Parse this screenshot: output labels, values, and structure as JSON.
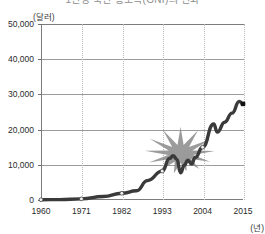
{
  "chart_data": {
    "type": "line",
    "title": "1인당 국민 총소득(GNI)의 변화",
    "unit_y": "(달러)",
    "unit_x": "(년)",
    "xlabel": "",
    "ylabel": "",
    "ylim": [
      0,
      50000
    ],
    "xlim": [
      1960,
      2015
    ],
    "yticks": [
      "0",
      "10,000",
      "20,000",
      "30,000",
      "40,000",
      "50,000"
    ],
    "ytick_values": [
      0,
      10000,
      20000,
      30000,
      40000,
      50000
    ],
    "xticks": [
      "1960",
      "1971",
      "1982",
      "1993",
      "2004",
      "2015"
    ],
    "xtick_values": [
      1960,
      1971,
      1982,
      1993,
      2004,
      2015
    ],
    "grid": "horizontal solid, vertical dotted",
    "legend": "none",
    "line_color": "#3a3a3a",
    "marker_color": "#f2f2f2",
    "annotation_color": "#8a8a8a",
    "annotations": [
      {
        "name": "crisis-starburst",
        "shape": "starburst",
        "year_center": 1998,
        "value_center": 8000
      }
    ],
    "x": [
      1960,
      1965,
      1971,
      1977,
      1982,
      1986,
      1989,
      1993,
      1995,
      1996,
      1997,
      1998,
      1999,
      2000,
      2001,
      2002,
      2004,
      2007,
      2008,
      2010,
      2012,
      2014,
      2015
    ],
    "values": [
      80,
      110,
      300,
      1000,
      1900,
      2600,
      5500,
      8200,
      11800,
      12600,
      11500,
      7700,
      9900,
      11300,
      10200,
      12100,
      15000,
      21600,
      19300,
      22100,
      24700,
      28000,
      27300
    ],
    "series": [
      {
        "name": "1인당 국민 총소득",
        "values": [
          80,
          110,
          300,
          1000,
          1900,
          2600,
          5500,
          8200,
          11800,
          12600,
          11500,
          7700,
          9900,
          11300,
          10200,
          12100,
          15000,
          21600,
          19300,
          22100,
          24700,
          28000,
          27300
        ]
      }
    ]
  }
}
